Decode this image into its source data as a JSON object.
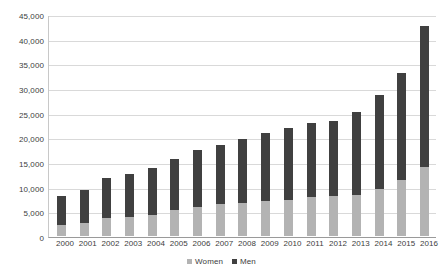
{
  "chart_data": {
    "type": "bar",
    "stacked": true,
    "title": "",
    "xlabel": "",
    "ylabel": "",
    "ylim": [
      0,
      45000
    ],
    "ytick_step": 5000,
    "grid": true,
    "legend_position": "bottom",
    "categories": [
      "2000",
      "2001",
      "2002",
      "2003",
      "2004",
      "2005",
      "2006",
      "2007",
      "2008",
      "2009",
      "2010",
      "2011",
      "2012",
      "2013",
      "2014",
      "2015",
      "2016"
    ],
    "ytick_labels": [
      "45,000",
      "40,000",
      "35,000",
      "30,000",
      "25,000",
      "20,000",
      "15,000",
      "10,000",
      "5,000",
      "0"
    ],
    "ytick_values": [
      45000,
      40000,
      35000,
      30000,
      25000,
      20000,
      15000,
      10000,
      5000,
      0
    ],
    "series": [
      {
        "name": "Women",
        "color": "#b3b3b3",
        "values": [
          2200,
          2700,
          3600,
          3900,
          4300,
          5200,
          5800,
          6400,
          6700,
          7000,
          7400,
          7900,
          8100,
          8400,
          9600,
          11400,
          13900
        ]
      },
      {
        "name": "Men",
        "color": "#404040",
        "values": [
          5900,
          6700,
          8200,
          8700,
          9500,
          10400,
          11700,
          12100,
          13000,
          13800,
          14400,
          15000,
          15300,
          16700,
          19000,
          21600,
          28600
        ]
      }
    ],
    "totals": [
      8100,
      9400,
      11800,
      12600,
      13800,
      15600,
      17500,
      18500,
      19700,
      20800,
      21800,
      22900,
      23400,
      25100,
      28600,
      33000,
      42500
    ]
  },
  "legend": {
    "items": [
      {
        "label": "Women",
        "color": "#b3b3b3"
      },
      {
        "label": "Men",
        "color": "#404040"
      }
    ]
  },
  "colors": {
    "women": "#b3b3b3",
    "men": "#404040",
    "gridline": "#d9d9d9",
    "axis": "#9a9a9a",
    "text": "#3d3d3d",
    "background": "#ffffff"
  }
}
